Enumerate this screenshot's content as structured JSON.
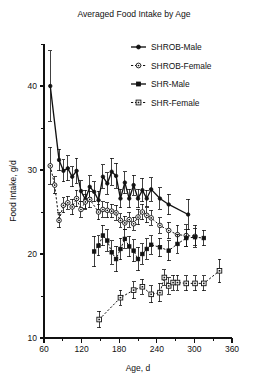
{
  "chart_data": {
    "type": "line",
    "title": "Averaged Food Intake by Age",
    "xlabel": "Age, d",
    "ylabel": "Food Intake, g/d",
    "xlim": [
      60,
      360
    ],
    "ylim": [
      10,
      45
    ],
    "x_ticks": [
      60,
      120,
      180,
      240,
      300,
      360
    ],
    "x_tick_labels": [
      "60",
      "120",
      "180",
      "240",
      "300",
      "360"
    ],
    "x_minor_step": 30,
    "y_ticks": [
      10,
      20,
      30,
      40
    ],
    "y_tick_labels": [
      "10",
      "20",
      "30",
      "40"
    ],
    "y_minor_step": 5,
    "grid": false,
    "legend_position": "top-right",
    "error_bars": "vertical, symmetric (SEM)",
    "series": [
      {
        "name": "SHROB-Male",
        "marker": "filled-circle",
        "line": "solid",
        "color": "#111111",
        "x": [
          70,
          84,
          91,
          98,
          105,
          112,
          119,
          126,
          133,
          140,
          147,
          154,
          161,
          168,
          175,
          182,
          189,
          196,
          203,
          210,
          217,
          224,
          231,
          245,
          259,
          290
        ],
        "y": [
          40.0,
          31.2,
          29.9,
          30.2,
          29.2,
          29.9,
          27.5,
          26.5,
          28.0,
          27.4,
          26.4,
          29.2,
          28.4,
          29.8,
          29.3,
          26.6,
          28.5,
          26.6,
          28.2,
          26.6,
          27.6,
          26.6,
          27.7,
          26.6,
          25.9,
          24.7
        ],
        "yerr": [
          4.2,
          1.3,
          1.3,
          1.5,
          1.2,
          1.5,
          1.2,
          1.1,
          1.3,
          1.2,
          1.1,
          1.4,
          1.3,
          1.6,
          1.5,
          1.1,
          1.3,
          1.1,
          1.2,
          1.1,
          1.4,
          1.0,
          1.4,
          1.3,
          1.2,
          1.8
        ]
      },
      {
        "name": "SHROB-Female",
        "marker": "open-circle-dot",
        "line": "dashed",
        "color": "#111111",
        "x": [
          70,
          77,
          84,
          91,
          98,
          105,
          112,
          119,
          126,
          133,
          147,
          154,
          161,
          168,
          175,
          182,
          189,
          196,
          203,
          210,
          217,
          224,
          231,
          245,
          259,
          273,
          287,
          301
        ],
        "y": [
          30.5,
          28.2,
          24.0,
          25.8,
          26.1,
          25.6,
          26.6,
          25.3,
          26.2,
          26.5,
          25.0,
          25.3,
          25.2,
          25.1,
          24.9,
          24.0,
          23.7,
          24.1,
          23.6,
          24.4,
          25.0,
          24.6,
          24.3,
          23.4,
          22.8,
          22.3,
          22.2,
          22.1
        ],
        "yerr": [
          2.2,
          1.0,
          0.9,
          0.9,
          0.8,
          0.9,
          1.0,
          0.9,
          0.9,
          1.0,
          0.9,
          0.9,
          0.9,
          0.8,
          0.9,
          0.8,
          0.8,
          0.9,
          0.8,
          0.9,
          0.9,
          0.9,
          0.9,
          0.9,
          1.0,
          1.1,
          1.3,
          1.3
        ]
      },
      {
        "name": "SHR-Male",
        "marker": "filled-square",
        "line": "dashed",
        "color": "#111111",
        "x": [
          140,
          147,
          154,
          161,
          168,
          175,
          182,
          189,
          196,
          203,
          210,
          217,
          224,
          231,
          245,
          259,
          273,
          287,
          301,
          315
        ],
        "y": [
          20.3,
          21.0,
          22.2,
          21.6,
          20.2,
          19.4,
          20.6,
          21.8,
          20.9,
          20.4,
          19.4,
          20.0,
          20.6,
          21.1,
          20.8,
          20.4,
          21.2,
          21.9,
          22.0,
          21.9
        ],
        "yerr": [
          1.8,
          1.2,
          1.2,
          1.3,
          1.4,
          1.5,
          1.3,
          1.1,
          1.2,
          1.3,
          1.4,
          1.2,
          1.2,
          1.1,
          1.1,
          1.2,
          1.1,
          1.0,
          1.0,
          0.9
        ]
      },
      {
        "name": "SHR-Female",
        "marker": "open-square-dot",
        "line": "dashed",
        "color": "#111111",
        "x": [
          148,
          182,
          203,
          217,
          231,
          245,
          252,
          259,
          266,
          273,
          287,
          301,
          315,
          340
        ],
        "y": [
          12.2,
          14.8,
          15.7,
          16.1,
          15.2,
          15.4,
          17.2,
          16.2,
          16.6,
          16.6,
          16.5,
          16.5,
          16.5,
          18.0
        ],
        "yerr": [
          1.0,
          0.9,
          1.0,
          0.9,
          1.0,
          1.1,
          0.9,
          1.0,
          0.9,
          0.9,
          0.9,
          0.9,
          0.9,
          1.4
        ]
      }
    ],
    "legend": [
      {
        "label": "SHROB-Male",
        "marker": "filled-circle",
        "line": "solid"
      },
      {
        "label": "SHROB-Female",
        "marker": "open-circle-dot",
        "line": "dashed"
      },
      {
        "label": "SHR-Male",
        "marker": "filled-square",
        "line": "solid"
      },
      {
        "label": "SHR-Female",
        "marker": "open-square-dot",
        "line": "dashed"
      }
    ]
  }
}
